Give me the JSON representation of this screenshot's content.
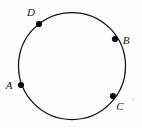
{
  "figure": {
    "type": "geometry-diagram",
    "background_color": "#fefefe",
    "stroke_color": "#0d0d0d",
    "point_color": "#0a0a0a",
    "label_color": "#141414",
    "circle": {
      "center_x": 72,
      "center_y": 66,
      "radius": 53.5,
      "stroke_width": 1.25
    },
    "points": [
      {
        "id": "A",
        "label": "A",
        "x": 21,
        "y": 85,
        "angle_deg": 199,
        "label_x": 9,
        "label_y": 89,
        "dot_radius": 3.1
      },
      {
        "id": "B",
        "label": "B",
        "x": 115,
        "y": 39,
        "angle_deg": 29,
        "label_x": 126,
        "label_y": 44,
        "dot_radius": 3.1
      },
      {
        "id": "C",
        "label": "C",
        "x": 113,
        "y": 96,
        "angle_deg": -32,
        "label_x": 120,
        "label_y": 110,
        "dot_radius": 3.1
      },
      {
        "id": "D",
        "label": "D",
        "x": 39,
        "y": 24,
        "angle_deg": 143,
        "label_x": 31,
        "label_y": 16,
        "dot_radius": 3.1
      }
    ]
  },
  "chart_data": {
    "type": "scatter",
    "title": "",
    "xlabel": "",
    "ylabel": "",
    "annotations": [
      "A",
      "B",
      "C",
      "D"
    ],
    "categories": [
      "A",
      "B",
      "C",
      "D"
    ],
    "values": [
      199,
      29,
      -32,
      143
    ],
    "series": [
      {
        "name": "points-on-circle",
        "values": [
          {
            "label": "A",
            "x": 21,
            "y": 85
          },
          {
            "label": "B",
            "x": 115,
            "y": 39
          },
          {
            "label": "C",
            "x": 113,
            "y": 96
          },
          {
            "label": "D",
            "x": 39,
            "y": 24
          }
        ]
      }
    ]
  }
}
